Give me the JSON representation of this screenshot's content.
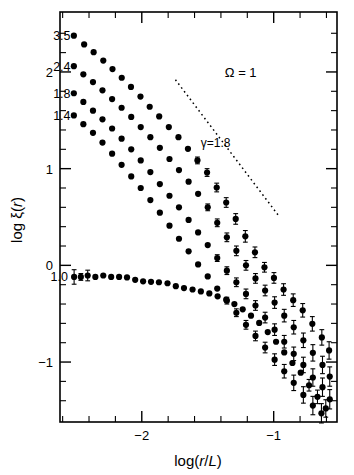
{
  "figure": {
    "background_color": "#ffffff",
    "ink_color": "#000000"
  },
  "chart_data": {
    "type": "scatter",
    "title": "",
    "xlabel": "log(r/L)",
    "ylabel": "log ξ(r)",
    "xlim": [
      -2.62,
      -0.52
    ],
    "ylim": [
      -1.62,
      2.62
    ],
    "grid": false,
    "legend_position": "inline-left-labels",
    "annotations": [
      {
        "name": "omega-annotation",
        "text": "Ω = 1",
        "x": -1.25,
        "y": 2.0
      },
      {
        "name": "gamma-annotation",
        "text": "γ=1.8",
        "x": -1.44,
        "y": 1.28
      }
    ],
    "reference_line": {
      "name": "gamma-slope-line",
      "label": "γ=1.8",
      "slope": -1.8,
      "style": "dotted",
      "x0": -1.745,
      "y0": 1.92,
      "x1": -0.955,
      "y1": 0.5
    },
    "x_ticks_major": [
      -2,
      -1
    ],
    "x_tick_labels": [
      "−2",
      "−1"
    ],
    "x_ticks_minor": [
      -2.6,
      -2.4,
      -2.2,
      -1.8,
      -1.6,
      -1.4,
      -1.2,
      -0.8,
      -0.6
    ],
    "y_ticks_major": [
      2,
      1,
      0,
      -1
    ],
    "y_tick_labels": [
      "2",
      "1",
      "0",
      "−1"
    ],
    "y_ticks_minor": [
      2.4,
      2.2,
      1.8,
      1.6,
      1.4,
      1.2,
      0.8,
      0.6,
      0.4,
      0.2,
      -0.2,
      -0.4,
      -0.6,
      -0.8,
      -1.2,
      -1.4
    ],
    "series": [
      {
        "name": "3.5",
        "label": "3.5",
        "label_x": -2.54,
        "label_y": 2.38,
        "points": [
          {
            "x": -2.515,
            "y": 2.375
          },
          {
            "x": -2.437,
            "y": 2.285
          },
          {
            "x": -2.365,
            "y": 2.205
          },
          {
            "x": -2.292,
            "y": 2.118
          },
          {
            "x": -2.222,
            "y": 2.03
          },
          {
            "x": -2.152,
            "y": 1.94
          },
          {
            "x": -2.082,
            "y": 1.845
          },
          {
            "x": -2.01,
            "y": 1.745
          },
          {
            "x": -1.94,
            "y": 1.64
          },
          {
            "x": -1.868,
            "y": 1.54
          },
          {
            "x": -1.795,
            "y": 1.43
          },
          {
            "x": -1.722,
            "y": 1.325
          },
          {
            "x": -1.65,
            "y": 1.205
          },
          {
            "x": -1.578,
            "y": 1.085,
            "yerr": 0.035
          },
          {
            "x": -1.505,
            "y": 0.96,
            "yerr": 0.04
          },
          {
            "x": -1.432,
            "y": 0.805,
            "yerr": 0.045
          },
          {
            "x": -1.36,
            "y": 0.65,
            "yerr": 0.05
          },
          {
            "x": -1.288,
            "y": 0.48,
            "yerr": 0.055
          },
          {
            "x": -1.215,
            "y": 0.3,
            "yerr": 0.06
          },
          {
            "x": -1.142,
            "y": 0.135,
            "yerr": 0.055
          },
          {
            "x": -1.07,
            "y": -0.02,
            "yerr": 0.05
          },
          {
            "x": -0.998,
            "y": -0.13,
            "yerr": 0.055
          },
          {
            "x": -0.925,
            "y": -0.25,
            "yerr": 0.06
          },
          {
            "x": -0.852,
            "y": -0.36,
            "yerr": 0.065
          },
          {
            "x": -0.78,
            "y": -0.465,
            "yerr": 0.07
          },
          {
            "x": -0.707,
            "y": -0.605,
            "yerr": 0.075
          },
          {
            "x": -0.635,
            "y": -0.745,
            "yerr": 0.08
          },
          {
            "x": -0.58,
            "y": -0.88,
            "yerr": 0.09
          }
        ]
      },
      {
        "name": "2.4",
        "label": "2.4",
        "label_x": -2.54,
        "label_y": 2.06,
        "points": [
          {
            "x": -2.515,
            "y": 2.06
          },
          {
            "x": -2.443,
            "y": 1.975
          },
          {
            "x": -2.37,
            "y": 1.895
          },
          {
            "x": -2.298,
            "y": 1.81
          },
          {
            "x": -2.225,
            "y": 1.72
          },
          {
            "x": -2.153,
            "y": 1.63
          },
          {
            "x": -2.08,
            "y": 1.535
          },
          {
            "x": -2.008,
            "y": 1.43
          },
          {
            "x": -1.935,
            "y": 1.325
          },
          {
            "x": -1.863,
            "y": 1.215
          },
          {
            "x": -1.79,
            "y": 1.1
          },
          {
            "x": -1.718,
            "y": 0.985
          },
          {
            "x": -1.645,
            "y": 0.865
          },
          {
            "x": -1.573,
            "y": 0.74
          },
          {
            "x": -1.5,
            "y": 0.6,
            "yerr": 0.035
          },
          {
            "x": -1.428,
            "y": 0.44,
            "yerr": 0.04
          },
          {
            "x": -1.355,
            "y": 0.29,
            "yerr": 0.045
          },
          {
            "x": -1.283,
            "y": 0.15,
            "yerr": 0.05
          },
          {
            "x": -1.21,
            "y": 0.0,
            "yerr": 0.05
          },
          {
            "x": -1.138,
            "y": -0.135,
            "yerr": 0.05
          },
          {
            "x": -1.065,
            "y": -0.26,
            "yerr": 0.055
          },
          {
            "x": -0.993,
            "y": -0.385,
            "yerr": 0.06
          },
          {
            "x": -0.92,
            "y": -0.52,
            "yerr": 0.065
          },
          {
            "x": -0.848,
            "y": -0.64,
            "yerr": 0.07
          },
          {
            "x": -0.775,
            "y": -0.775,
            "yerr": 0.075
          },
          {
            "x": -0.703,
            "y": -0.905,
            "yerr": 0.085
          },
          {
            "x": -0.63,
            "y": -1.03,
            "yerr": 0.09
          },
          {
            "x": -0.575,
            "y": -1.15,
            "yerr": 0.1
          }
        ]
      },
      {
        "name": "1.8",
        "label": "1.8",
        "label_x": -2.54,
        "label_y": 1.78,
        "points": [
          {
            "x": -2.515,
            "y": 1.78
          },
          {
            "x": -2.443,
            "y": 1.69
          },
          {
            "x": -2.37,
            "y": 1.6
          },
          {
            "x": -2.298,
            "y": 1.51
          },
          {
            "x": -2.225,
            "y": 1.415
          },
          {
            "x": -2.153,
            "y": 1.31
          },
          {
            "x": -2.08,
            "y": 1.2
          },
          {
            "x": -2.008,
            "y": 1.085
          },
          {
            "x": -1.935,
            "y": 0.965
          },
          {
            "x": -1.863,
            "y": 0.84
          },
          {
            "x": -1.79,
            "y": 0.72
          },
          {
            "x": -1.718,
            "y": 0.6
          },
          {
            "x": -1.645,
            "y": 0.47
          },
          {
            "x": -1.573,
            "y": 0.34
          },
          {
            "x": -1.5,
            "y": 0.21
          },
          {
            "x": -1.428,
            "y": 0.075,
            "yerr": 0.035
          },
          {
            "x": -1.355,
            "y": -0.055,
            "yerr": 0.04
          },
          {
            "x": -1.283,
            "y": -0.175,
            "yerr": 0.045
          },
          {
            "x": -1.21,
            "y": -0.295,
            "yerr": 0.05
          },
          {
            "x": -1.138,
            "y": -0.415,
            "yerr": 0.05
          },
          {
            "x": -1.065,
            "y": -0.54,
            "yerr": 0.055
          },
          {
            "x": -0.993,
            "y": -0.665,
            "yerr": 0.06
          },
          {
            "x": -0.92,
            "y": -0.79,
            "yerr": 0.065
          },
          {
            "x": -0.848,
            "y": -0.915,
            "yerr": 0.07
          },
          {
            "x": -0.775,
            "y": -1.03,
            "yerr": 0.08
          },
          {
            "x": -0.703,
            "y": -1.16,
            "yerr": 0.09
          },
          {
            "x": -0.63,
            "y": -1.26,
            "yerr": 0.095
          },
          {
            "x": -0.575,
            "y": -1.385,
            "yerr": 0.1
          }
        ]
      },
      {
        "name": "1.4",
        "label": "1.4",
        "label_x": -2.54,
        "label_y": 1.55,
        "points": [
          {
            "x": -2.515,
            "y": 1.55
          },
          {
            "x": -2.443,
            "y": 1.46
          },
          {
            "x": -2.37,
            "y": 1.37
          },
          {
            "x": -2.298,
            "y": 1.27
          },
          {
            "x": -2.225,
            "y": 1.155
          },
          {
            "x": -2.153,
            "y": 1.04
          },
          {
            "x": -2.08,
            "y": 0.92
          },
          {
            "x": -2.008,
            "y": 0.8
          },
          {
            "x": -1.935,
            "y": 0.675
          },
          {
            "x": -1.863,
            "y": 0.545
          },
          {
            "x": -1.79,
            "y": 0.41
          },
          {
            "x": -1.718,
            "y": 0.275
          },
          {
            "x": -1.645,
            "y": 0.145
          },
          {
            "x": -1.573,
            "y": 0.01
          },
          {
            "x": -1.5,
            "y": -0.115
          },
          {
            "x": -1.428,
            "y": -0.24
          },
          {
            "x": -1.355,
            "y": -0.365,
            "yerr": 0.035
          },
          {
            "x": -1.283,
            "y": -0.49,
            "yerr": 0.04
          },
          {
            "x": -1.21,
            "y": -0.615,
            "yerr": 0.045
          },
          {
            "x": -1.138,
            "y": -0.73,
            "yerr": 0.05
          },
          {
            "x": -1.065,
            "y": -0.85,
            "yerr": 0.055
          },
          {
            "x": -0.993,
            "y": -0.975,
            "yerr": 0.06
          },
          {
            "x": -0.92,
            "y": -1.095,
            "yerr": 0.07
          },
          {
            "x": -0.848,
            "y": -1.215,
            "yerr": 0.08
          },
          {
            "x": -0.775,
            "y": -1.34,
            "yerr": 0.085
          },
          {
            "x": -0.703,
            "y": -1.45,
            "yerr": 0.095
          },
          {
            "x": -0.638,
            "y": -1.53,
            "yerr": 0.1
          }
        ]
      },
      {
        "name": "1.0",
        "label": "1.0",
        "label_x": -2.56,
        "label_y": -0.115,
        "points": [
          {
            "x": -2.513,
            "y": -0.12,
            "yerr": 0.075
          },
          {
            "x": -2.462,
            "y": -0.12,
            "yerr": 0.035
          },
          {
            "x": -2.41,
            "y": -0.105,
            "yerr": 0.055
          },
          {
            "x": -2.352,
            "y": -0.12
          },
          {
            "x": -2.292,
            "y": -0.105
          },
          {
            "x": -2.232,
            "y": -0.12
          },
          {
            "x": -2.172,
            "y": -0.12
          },
          {
            "x": -2.112,
            "y": -0.125
          },
          {
            "x": -2.05,
            "y": -0.15
          },
          {
            "x": -1.99,
            "y": -0.165
          },
          {
            "x": -1.93,
            "y": -0.17
          },
          {
            "x": -1.87,
            "y": -0.175
          },
          {
            "x": -1.805,
            "y": -0.185
          },
          {
            "x": -1.742,
            "y": -0.215
          },
          {
            "x": -1.68,
            "y": -0.235
          },
          {
            "x": -1.615,
            "y": -0.25
          },
          {
            "x": -1.552,
            "y": -0.27
          },
          {
            "x": -1.488,
            "y": -0.29
          },
          {
            "x": -1.425,
            "y": -0.32
          },
          {
            "x": -1.36,
            "y": -0.355
          },
          {
            "x": -1.298,
            "y": -0.4
          },
          {
            "x": -1.235,
            "y": -0.455
          },
          {
            "x": -1.172,
            "y": -0.52
          },
          {
            "x": -1.11,
            "y": -0.595
          },
          {
            "x": -1.045,
            "y": -0.69
          },
          {
            "x": -0.982,
            "y": -0.79
          },
          {
            "x": -0.92,
            "y": -0.9
          },
          {
            "x": -0.858,
            "y": -1.01
          },
          {
            "x": -0.795,
            "y": -1.11
          },
          {
            "x": -0.732,
            "y": -1.24,
            "yerr": 0.06
          },
          {
            "x": -0.668,
            "y": -1.36,
            "yerr": 0.07
          },
          {
            "x": -0.605,
            "y": -1.48,
            "yerr": 0.09
          }
        ]
      }
    ]
  }
}
